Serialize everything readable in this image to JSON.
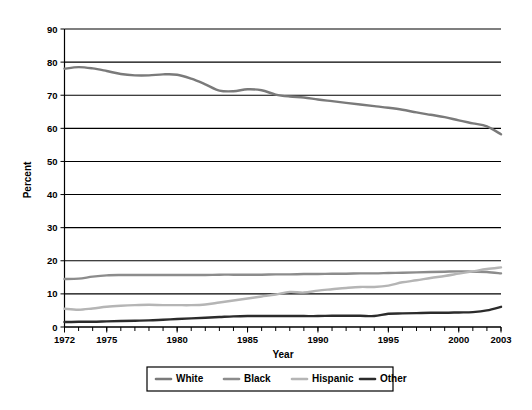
{
  "chart_data": {
    "type": "line",
    "title": "",
    "xlabel": "Year",
    "ylabel": "Percent",
    "xlim": [
      1972,
      2003
    ],
    "ylim": [
      0,
      90
    ],
    "grid": true,
    "legend_position": "bottom",
    "x_tick_labels": [
      "1972",
      "1975",
      "1980",
      "1985",
      "1990",
      "1995",
      "2000",
      "2003"
    ],
    "x_tick_values": [
      1972,
      1975,
      1980,
      1985,
      1990,
      1995,
      2000,
      2003
    ],
    "y_tick_labels": [
      "0",
      "10",
      "20",
      "30",
      "40",
      "50",
      "60",
      "70",
      "80",
      "90"
    ],
    "y_tick_values": [
      0,
      10,
      20,
      30,
      40,
      50,
      60,
      70,
      80,
      90
    ],
    "x": [
      1972,
      1973,
      1974,
      1975,
      1976,
      1977,
      1978,
      1979,
      1980,
      1981,
      1982,
      1983,
      1984,
      1985,
      1986,
      1987,
      1988,
      1989,
      1990,
      1991,
      1992,
      1993,
      1994,
      1995,
      1996,
      1997,
      1998,
      1999,
      2000,
      2001,
      2002,
      2003
    ],
    "series": [
      {
        "name": "White",
        "color": "#7a7a7a",
        "values": [
          78.0,
          78.5,
          78.1,
          77.3,
          76.4,
          76.0,
          76.0,
          76.3,
          76.2,
          75.0,
          73.3,
          71.4,
          71.2,
          71.8,
          71.5,
          70.2,
          69.6,
          69.3,
          68.7,
          68.2,
          67.7,
          67.2,
          66.7,
          66.2,
          65.6,
          64.8,
          64.1,
          63.4,
          62.4,
          61.5,
          60.6,
          58.2
        ]
      },
      {
        "name": "Black",
        "color": "#8c8c8c",
        "values": [
          14.5,
          14.6,
          15.2,
          15.6,
          15.7,
          15.7,
          15.7,
          15.7,
          15.7,
          15.7,
          15.7,
          15.8,
          15.8,
          15.8,
          15.8,
          15.9,
          15.9,
          16.0,
          16.0,
          16.1,
          16.1,
          16.2,
          16.2,
          16.3,
          16.4,
          16.5,
          16.6,
          16.7,
          16.8,
          16.7,
          16.6,
          16.2
        ]
      },
      {
        "name": "Hispanic",
        "color": "#b5b5b5",
        "values": [
          5.5,
          5.2,
          5.6,
          6.1,
          6.4,
          6.6,
          6.7,
          6.6,
          6.6,
          6.6,
          6.8,
          7.4,
          8.0,
          8.6,
          9.2,
          9.8,
          10.6,
          10.4,
          11.0,
          11.4,
          11.8,
          12.1,
          12.1,
          12.5,
          13.5,
          14.1,
          14.8,
          15.4,
          16.1,
          16.8,
          17.5,
          18.0
        ]
      },
      {
        "name": "Other",
        "color": "#2b2b2b",
        "values": [
          1.5,
          1.6,
          1.6,
          1.7,
          1.8,
          1.9,
          2.0,
          2.2,
          2.4,
          2.6,
          2.8,
          3.0,
          3.2,
          3.3,
          3.3,
          3.3,
          3.3,
          3.3,
          3.3,
          3.4,
          3.4,
          3.4,
          3.3,
          4.0,
          4.1,
          4.2,
          4.3,
          4.3,
          4.4,
          4.5,
          5.0,
          6.1
        ]
      }
    ]
  },
  "legend": {
    "items": [
      {
        "label": "White"
      },
      {
        "label": "Black"
      },
      {
        "label": "Hispanic"
      },
      {
        "label": "Other"
      }
    ]
  },
  "axes": {
    "x_title": "Year",
    "y_title": "Percent"
  }
}
